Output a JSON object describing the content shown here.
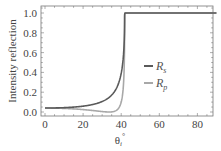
{
  "chart_data": {
    "type": "line",
    "title": "",
    "xlabel": "θ",
    "xlabel_subscript": "i",
    "xlabel_superscript": "°",
    "ylabel": "Intensity reflection",
    "xlim": [
      0,
      90
    ],
    "ylim": [
      -0.05,
      1.07
    ],
    "grid": false,
    "legend_position": "center-right",
    "x_ticks": [
      0,
      20,
      40,
      60,
      80
    ],
    "x_tick_labels": [
      "0",
      "20",
      "40",
      "60",
      "80"
    ],
    "y_ticks": [
      0.0,
      0.2,
      0.4,
      0.6,
      0.8,
      1.0
    ],
    "y_tick_labels": [
      "0.0",
      "0.2",
      "0.4",
      "0.6",
      "0.8",
      "1.0"
    ],
    "physics": {
      "n1": 1.5,
      "n2": 1.0,
      "critical_angle_deg": 41.81,
      "brewster_angle_deg": 33.69
    },
    "series": [
      {
        "name": "R_s",
        "label_main": "R",
        "label_sub": "s",
        "color": "#5a5a5a",
        "x": [
          0,
          10,
          20,
          30,
          33.7,
          35,
          38,
          40,
          41,
          41.5,
          41.81,
          50,
          60,
          70,
          80,
          90
        ],
        "values": [
          0.04,
          0.043,
          0.055,
          0.092,
          0.148,
          0.18,
          0.3,
          0.45,
          0.6,
          0.74,
          1.0,
          1.0,
          1.0,
          1.0,
          1.0,
          1.0
        ]
      },
      {
        "name": "R_p",
        "label_main": "R",
        "label_sub": "p",
        "color": "#a8a8a8",
        "x": [
          0,
          10,
          20,
          30,
          33.7,
          35,
          38,
          40,
          41,
          41.5,
          41.81,
          50,
          60,
          70,
          80,
          90
        ],
        "values": [
          0.04,
          0.037,
          0.026,
          0.007,
          0.0,
          0.005,
          0.06,
          0.19,
          0.36,
          0.55,
          1.0,
          1.0,
          1.0,
          1.0,
          1.0,
          1.0
        ]
      }
    ]
  },
  "layout": {
    "frame": {
      "left": 41,
      "top": 6,
      "right": 213,
      "bottom": 116
    },
    "x_px_per_unit": 1.905,
    "y_zero_px": 112,
    "y_px_per_unit": 99
  }
}
